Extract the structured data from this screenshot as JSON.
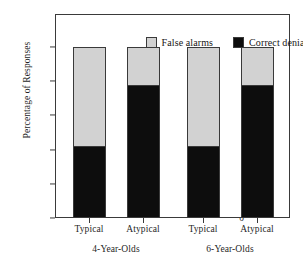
{
  "chart_data": {
    "type": "bar",
    "stacked": true,
    "title": "",
    "xlabel": "",
    "ylabel": "Percentage of Responses",
    "ylim": [
      0,
      100
    ],
    "yticks": [
      0,
      20,
      40,
      60,
      80,
      100
    ],
    "ytick_labels": [
      "0",
      "20",
      "40",
      "60",
      "80",
      "100"
    ],
    "grid": false,
    "legend_position": "top-inside",
    "categories": [
      "Typical",
      "Atypical",
      "Typical",
      "Atypical"
    ],
    "groups": [
      {
        "label": "4-Year-Olds",
        "categories": [
          "Typical",
          "Atypical"
        ]
      },
      {
        "label": "6-Year-Olds",
        "categories": [
          "Typical",
          "Atypical"
        ]
      }
    ],
    "series": [
      {
        "name": "Correct denials",
        "color": "#0d0d0d",
        "values": [
          42,
          78,
          42,
          78
        ]
      },
      {
        "name": "False alarms",
        "color": "#d2d2d2",
        "values": [
          58,
          22,
          58,
          22
        ]
      }
    ]
  },
  "legend": {
    "entries": [
      {
        "label": "False alarms",
        "color": "#d2d2d2"
      },
      {
        "label": "Correct denials",
        "color": "#0d0d0d"
      }
    ]
  },
  "axes": {
    "y_title": "Percentage of Responses",
    "y_tick_labels": [
      "100",
      "80",
      "60",
      "40",
      "20",
      "0"
    ],
    "x_tick_labels": [
      "Typical",
      "Atypical",
      "Typical",
      "Atypical"
    ],
    "group_labels": [
      "4-Year-Olds",
      "6-Year-Olds"
    ]
  },
  "colors": {
    "false_alarms": "#d2d2d2",
    "correct_denials": "#0d0d0d",
    "axis": "#3a3a3a",
    "background": "#ffffff"
  }
}
